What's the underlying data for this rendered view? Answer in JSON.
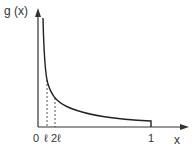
{
  "diagram": {
    "y_axis_label": "g (x)",
    "x_axis_label": "x",
    "tick_labels": {
      "origin": "0",
      "ell": "ℓ",
      "two_ell": "2ℓ",
      "one": "1"
    }
  },
  "colors": {
    "axis": "#333333",
    "curve": "#222222",
    "dashed": "#444444"
  }
}
